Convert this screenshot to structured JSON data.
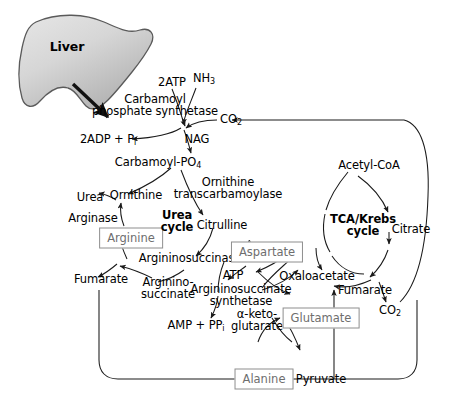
{
  "diagram": {
    "organ": {
      "label": "Liver"
    },
    "cycles": [
      {
        "name": "urea-cycle",
        "line1": "Urea",
        "line2": "cycle"
      },
      {
        "name": "tca-cycle",
        "line1": "TCA/Krebs",
        "line2": "cycle"
      }
    ],
    "enzymes": [
      {
        "id": "cps",
        "line1": "Carbamoyl",
        "line2": "phosphate synthetase"
      },
      {
        "id": "otc",
        "line1": "Ornithine",
        "line2": "transcarbamoylase"
      },
      {
        "id": "arginase",
        "line1": "Arginase"
      },
      {
        "id": "argininosuccinase",
        "line1": "Argininosuccinase"
      },
      {
        "id": "ass",
        "line1": "Argininosuccinate",
        "line2": "synthetase"
      }
    ],
    "metabolites": {
      "atp2": "2ATP",
      "nh3": "NH",
      "nh3_sub": "3",
      "co2_top": "CO",
      "co2_top_sub": "2",
      "adp": "2ADP + P",
      "adp_sub": "i",
      "nag": "NAG",
      "carbamoyl_p": "Carbamoyl-PO",
      "carbamoyl_p_sub": "4",
      "urea": "Urea",
      "ornithine": "Ornithine",
      "citrulline": "Citrulline",
      "argininosuccinate_1": "Arginino-",
      "argininosuccinate_2": "succinate",
      "fumarate_urea": "Fumarate",
      "atp": "ATP",
      "amp": "AMP + PP",
      "amp_sub": "i",
      "akg_1": "α-keto-",
      "akg_2": "glutarate",
      "acetyl_coa": "Acetyl-CoA",
      "citrate": "Citrate",
      "oxaloacetate": "Oxaloacetate",
      "fumarate_tca": "Fumarate",
      "co2_tca": "CO",
      "co2_tca_sub": "2",
      "pyruvate": "Pyruvate"
    },
    "boxed_metabolites": [
      {
        "id": "arginine",
        "label": "Arginine"
      },
      {
        "id": "aspartate",
        "label": "Aspartate"
      },
      {
        "id": "glutamate",
        "label": "Glutamate"
      },
      {
        "id": "alanine",
        "label": "Alanine"
      }
    ],
    "colors": {
      "stroke": "#1a1a1a",
      "box_border": "#8e8e8e",
      "box_text": "#6e6e6e",
      "liver_fill_light": "#e2e2e2",
      "liver_fill_dark": "#b4b4b4",
      "liver_edge": "#555555",
      "background": "#ffffff"
    }
  }
}
